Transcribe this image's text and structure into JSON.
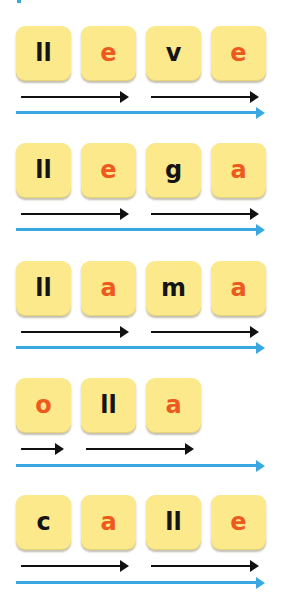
{
  "colors": {
    "card": "#fbe98c",
    "consonant": "#141414",
    "vowel": "#ee5a1e",
    "syllable_arrow": "#111111",
    "word_arrow": "#3aa8e0"
  },
  "words": [
    {
      "word": "lleve",
      "tiles": [
        {
          "text": "ll",
          "type": "consonant"
        },
        {
          "text": "e",
          "type": "vowel"
        },
        {
          "text": "v",
          "type": "consonant"
        },
        {
          "text": "e",
          "type": "vowel"
        }
      ],
      "syllables": [
        "lle",
        "ve"
      ]
    },
    {
      "word": "llega",
      "tiles": [
        {
          "text": "ll",
          "type": "consonant"
        },
        {
          "text": "e",
          "type": "vowel"
        },
        {
          "text": "g",
          "type": "consonant"
        },
        {
          "text": "a",
          "type": "vowel"
        }
      ],
      "syllables": [
        "lle",
        "ga"
      ]
    },
    {
      "word": "llama",
      "tiles": [
        {
          "text": "ll",
          "type": "consonant"
        },
        {
          "text": "a",
          "type": "vowel"
        },
        {
          "text": "m",
          "type": "consonant"
        },
        {
          "text": "a",
          "type": "vowel"
        }
      ],
      "syllables": [
        "lla",
        "ma"
      ]
    },
    {
      "word": "olla",
      "tiles": [
        {
          "text": "o",
          "type": "vowel"
        },
        {
          "text": "ll",
          "type": "consonant"
        },
        {
          "text": "a",
          "type": "vowel"
        }
      ],
      "syllables": [
        "o",
        "lla"
      ]
    },
    {
      "word": "calle",
      "tiles": [
        {
          "text": "c",
          "type": "consonant"
        },
        {
          "text": "a",
          "type": "vowel"
        },
        {
          "text": "ll",
          "type": "consonant"
        },
        {
          "text": "e",
          "type": "vowel"
        }
      ],
      "syllables": [
        "ca",
        "lle"
      ]
    }
  ]
}
